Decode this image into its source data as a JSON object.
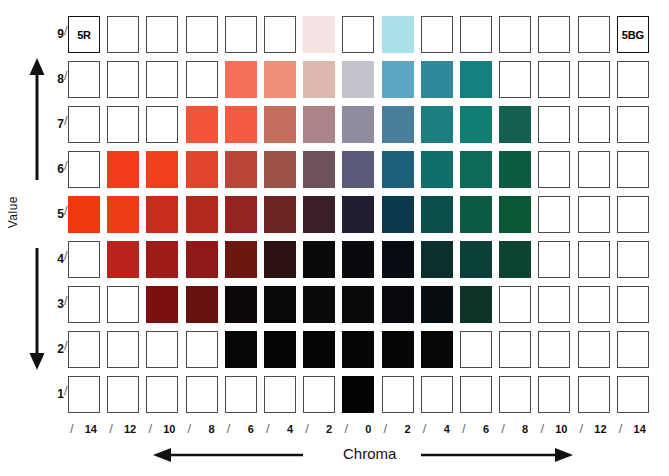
{
  "chart_data": {
    "type": "heatmap",
    "xlabel": "Chroma",
    "ylabel": "Value",
    "grid": true,
    "legend": "none",
    "hue_left_label": "5R",
    "hue_right_label": "5BG",
    "x_tick_labels": [
      "14",
      "12",
      "10",
      "8",
      "6",
      "4",
      "2",
      "0",
      "2",
      "4",
      "6",
      "8",
      "10",
      "12",
      "14"
    ],
    "x_tick_prefix": "/",
    "y_tick_labels": [
      "9",
      "8",
      "7",
      "6",
      "5",
      "4",
      "3",
      "2",
      "1"
    ],
    "y_tick_suffix": "/",
    "columns": 15,
    "rows": 9,
    "chroma_values": [
      14,
      12,
      10,
      8,
      6,
      4,
      2,
      0,
      2,
      4,
      6,
      8,
      10,
      12,
      14
    ],
    "hue_side": [
      "5R",
      "5R",
      "5R",
      "5R",
      "5R",
      "5R",
      "5R",
      "N",
      "5BG",
      "5BG",
      "5BG",
      "5BG",
      "5BG",
      "5BG",
      "5BG"
    ],
    "value_rows": [
      9,
      8,
      7,
      6,
      5,
      4,
      3,
      2,
      1
    ],
    "cells": [
      {
        "value": 9,
        "colors": [
          null,
          null,
          null,
          null,
          null,
          null,
          "#f7e3e4",
          null,
          "#ace0e8",
          null,
          null,
          null,
          null,
          null,
          null
        ]
      },
      {
        "value": 8,
        "colors": [
          null,
          null,
          null,
          null,
          "#f4705a",
          "#f08f78",
          "#dfb8ad",
          "#c3c4cb",
          "#5ba7c4",
          "#2c8a9c",
          "#14807f",
          null,
          null,
          null,
          null
        ]
      },
      {
        "value": 7,
        "colors": [
          null,
          null,
          null,
          "#f4553a",
          "#f35b41",
          "#c5705f",
          "#ac8386",
          "#8e8c9e",
          "#4a7f9c",
          "#1b7e80",
          "#0e7f72",
          "#14604f",
          null,
          null,
          null
        ]
      },
      {
        "value": 6,
        "colors": [
          null,
          "#f23b1b",
          "#f2401f",
          "#e2442c",
          "#b84639",
          "#9c5247",
          "#6d5359",
          "#585a77",
          "#1e5f7c",
          "#0f6f6b",
          "#0c6b57",
          "#0c5c41",
          null,
          null,
          null
        ]
      },
      {
        "value": 5,
        "colors": [
          "#f0380f",
          "#ed3b14",
          "#c72d1c",
          "#b32a1c",
          "#932321",
          "#6c2522",
          "#3a2026",
          "#221d33",
          "#0c3a4d",
          "#0b4e4b",
          "#0a5a44",
          "#0a5635",
          null,
          null,
          null
        ]
      },
      {
        "value": 4,
        "colors": [
          null,
          "#bb241d",
          "#9d1c18",
          "#8d1a17",
          "#6d1713",
          "#2c1210",
          "#0b0a0b",
          "#0a0a0e",
          "#090b12",
          "#0b2f2d",
          "#0a4038",
          "#0c4430",
          null,
          null,
          null
        ]
      },
      {
        "value": 3,
        "colors": [
          null,
          null,
          "#7d0f0e",
          "#66100f",
          "#0d0708",
          "#0a0709",
          "#0a090b",
          "#09090c",
          "#08090e",
          "#080d12",
          "#0c3326",
          null,
          null,
          null,
          null
        ]
      },
      {
        "value": 2,
        "colors": [
          null,
          null,
          null,
          null,
          "#060606",
          "#050505",
          "#050505",
          "#050505",
          "#050505",
          "#060606",
          null,
          null,
          null,
          null,
          null
        ]
      },
      {
        "value": 1,
        "colors": [
          null,
          null,
          null,
          null,
          null,
          null,
          null,
          "#030303",
          null,
          null,
          null,
          null,
          null,
          null,
          null
        ]
      }
    ],
    "labelled_cells": [
      {
        "row_value": 9,
        "column_index": 0,
        "text": "5R"
      },
      {
        "row_value": 9,
        "column_index": 14,
        "text": "5BG"
      }
    ]
  },
  "axes": {
    "value": {
      "title": "Value",
      "arrow": "double-vertical",
      "ticks": [
        "9",
        "8",
        "7",
        "6",
        "5",
        "4",
        "3",
        "2",
        "1"
      ],
      "slash": "/"
    },
    "chroma": {
      "title": "Chroma",
      "arrow": "double-horizontal",
      "ticks": [
        "14",
        "12",
        "10",
        "8",
        "6",
        "4",
        "2",
        "0",
        "2",
        "4",
        "6",
        "8",
        "10",
        "12",
        "14"
      ],
      "slash": "/"
    }
  },
  "colors": {
    "cell_border": "#4a4a4a",
    "label_border": "#111111",
    "axis_line": "#111111",
    "slash": "#6b6b6b",
    "background": "#ffffff"
  }
}
